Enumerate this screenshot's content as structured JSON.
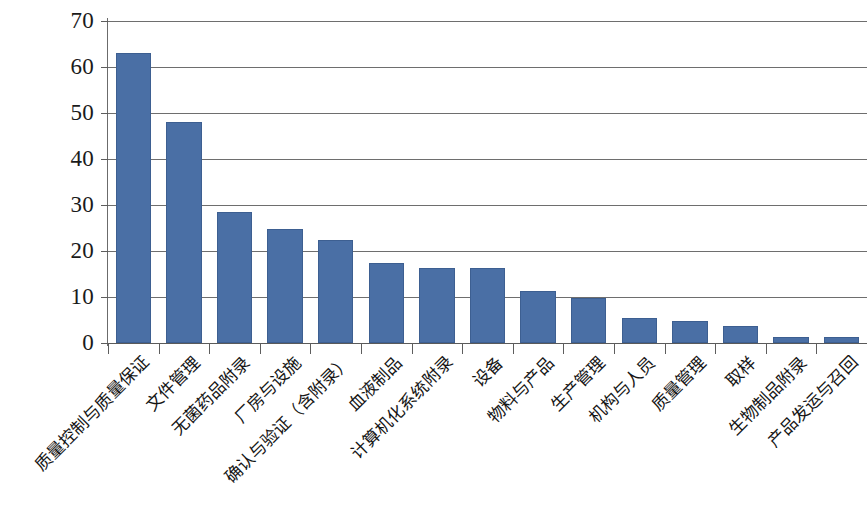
{
  "chart_data": {
    "type": "bar",
    "title": "",
    "subtitle": "",
    "xlabel": "",
    "ylabel": "",
    "ylim": [
      0,
      70
    ],
    "ytick_labels": [
      "70",
      "60",
      "50",
      "40",
      "30",
      "20",
      "10",
      "0"
    ],
    "ytick_values": [
      70,
      60,
      50,
      40,
      30,
      20,
      10,
      0
    ],
    "grid": true,
    "legend": false,
    "legend_position": "none",
    "bar_color": "#4a6fa5",
    "bar_edge_color": "#3d5f91",
    "gridline_color": "#6e6e6e",
    "axis_color": "#5d5d5d",
    "categories": [
      "质量控制与质量保证",
      "文件管理",
      "无菌药品附录",
      "厂房与设施",
      "确认与验证（含附录）",
      "血液制品",
      "计算机化系统附录",
      "设备",
      "物料与产品",
      "生产管理",
      "机构与人员",
      "质量管理",
      "取样",
      "生物制品附录",
      "产品发运与召回"
    ],
    "values": [
      63,
      48,
      28.5,
      24.7,
      22.5,
      17.4,
      16.2,
      16.2,
      11.3,
      9.7,
      5.4,
      4.7,
      3.6,
      1.4,
      1.4
    ]
  }
}
